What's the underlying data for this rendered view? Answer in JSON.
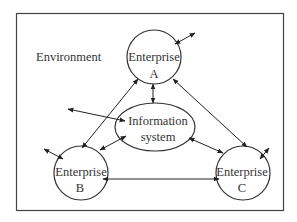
{
  "diagram": {
    "environment_label": "Environment",
    "nodes": {
      "enterprise_a": {
        "line1": "Enterprise",
        "line2": "A"
      },
      "enterprise_b": {
        "line1": "Enterprise",
        "line2": "B"
      },
      "enterprise_c": {
        "line1": "Enterprise",
        "line2": "C"
      },
      "information_system": {
        "line1": "Information",
        "line2": "system"
      }
    },
    "edges": [
      {
        "from": "Enterprise A",
        "to": "Information system",
        "type": "bidirectional"
      },
      {
        "from": "Enterprise A",
        "to": "Enterprise B",
        "type": "bidirectional"
      },
      {
        "from": "Enterprise A",
        "to": "Enterprise C",
        "type": "bidirectional"
      },
      {
        "from": "Enterprise B",
        "to": "Information system",
        "type": "bidirectional"
      },
      {
        "from": "Enterprise C",
        "to": "Information system",
        "type": "bidirectional"
      },
      {
        "from": "Enterprise B",
        "to": "Enterprise C",
        "type": "bidirectional"
      },
      {
        "from": "Enterprise A",
        "to": "Environment",
        "type": "bidirectional"
      },
      {
        "from": "Enterprise B",
        "to": "Environment",
        "type": "bidirectional"
      },
      {
        "from": "Enterprise C",
        "to": "Environment",
        "type": "bidirectional"
      },
      {
        "from": "Information system",
        "to": "Environment",
        "type": "bidirectional"
      }
    ],
    "colors": {
      "stroke": "#333333",
      "background": "#ffffff"
    }
  }
}
